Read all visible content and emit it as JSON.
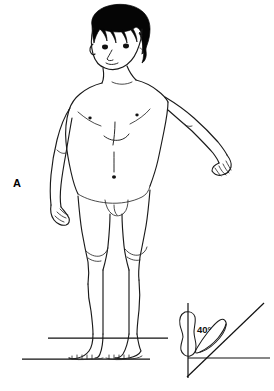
{
  "figure": {
    "panel_label": "A",
    "background_color": "#ffffff",
    "ink_color": "#111111",
    "hair_color": "#050505",
    "width": 274,
    "height": 391
  },
  "subject_figure": {
    "head": {
      "name": "head",
      "hair_style": "bowl cut with bangs",
      "features": [
        "left-eye",
        "right-eye",
        "nose",
        "mouth",
        "ear"
      ]
    },
    "torso": {
      "name": "torso",
      "landmarks": [
        "left-nipple",
        "right-nipple",
        "sternum-midline",
        "abdominal-midline",
        "navel"
      ]
    },
    "arms": {
      "left_arm": "adducted at side, hand near hip with fingers visible",
      "right_arm": "abducted away from body, hand extended with fingers visible"
    },
    "legs": {
      "name": "legs",
      "landmarks": [
        "left-knee",
        "right-knee",
        "left-ankle",
        "right-ankle",
        "toes"
      ]
    }
  },
  "ground": {
    "upper_reference_line": "ankle-level reference line",
    "lower_reference_line": "floor line beneath toes"
  },
  "inset": {
    "name": "foot-progression-angle-inset",
    "angle_value": "40°",
    "elements": {
      "vertical_reference": "vertical line of progression",
      "horizontal_reference": "horizontal floor line",
      "neutral_foot": "neutral foot outline aligned with vertical axis",
      "rotated_foot": "externally rotated foot outline",
      "angle_ray": "oblique ray indicating direction of foot rotation"
    }
  }
}
